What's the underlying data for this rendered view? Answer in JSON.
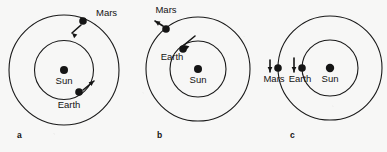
{
  "figure": {
    "type": "orbital-diagram",
    "background_color": "#f7f7f6",
    "line_color": "#1a1a1a",
    "body_color": "#151515"
  },
  "panels": [
    {
      "id": "a",
      "label": "a",
      "label_pos": {
        "x": 17,
        "y": 138
      },
      "sun": {
        "name": "Sun",
        "label": "Sun",
        "cx": 64,
        "cy": 70,
        "r": 4.0,
        "label_x": 64,
        "label_y": 84
      },
      "orbits": [
        {
          "name": "earth-orbit",
          "cx": 64,
          "cy": 70,
          "r": 29.5
        },
        {
          "name": "mars-orbit",
          "cx": 64,
          "cy": 70,
          "r": 55.0
        }
      ],
      "bodies": [
        {
          "name": "Mars",
          "label": "Mars",
          "cx": 83,
          "cy": 21,
          "r": 3.8,
          "label_x": 96,
          "label_y": 16,
          "label_anchor": "start",
          "arrow": {
            "x1": 81,
            "y1": 25,
            "x2": 72,
            "y2": 33,
            "head_angle": 222
          }
        },
        {
          "name": "Earth",
          "label": "Earth",
          "cx": 79,
          "cy": 92,
          "r": 3.8,
          "label_x": 69,
          "label_y": 108,
          "label_anchor": "middle",
          "arrow": {
            "x1": 83,
            "y1": 90,
            "x2": 94,
            "y2": 81,
            "head_angle": 321
          }
        }
      ]
    },
    {
      "id": "b",
      "label": "b",
      "label_pos": {
        "x": 157,
        "y": 138
      },
      "sun": {
        "name": "Sun",
        "label": "Sun",
        "cx": 198,
        "cy": 69,
        "r": 4.0,
        "label_x": 198,
        "label_y": 83
      },
      "orbits": [
        {
          "name": "earth-orbit",
          "cx": 198,
          "cy": 69,
          "r": 28.0
        },
        {
          "name": "mars-orbit",
          "cx": 198,
          "cy": 69,
          "r": 52.0
        }
      ],
      "bodies": [
        {
          "name": "Mars",
          "label": "Mars",
          "cx": 166,
          "cy": 29,
          "r": 3.8,
          "label_x": 166,
          "label_y": 13,
          "label_anchor": "middle",
          "arrow": {
            "x1": 163,
            "y1": 26,
            "x2": 155,
            "y2": 21,
            "head_angle": 212
          }
        },
        {
          "name": "Earth",
          "label": "Earth",
          "cx": 183,
          "cy": 49,
          "r": 3.8,
          "label_x": 172,
          "label_y": 60,
          "label_anchor": "middle",
          "arrow": {
            "x1": 195,
            "y1": 36,
            "x2": 184,
            "y2": 45,
            "head_angle": 219
          }
        }
      ]
    },
    {
      "id": "c",
      "label": "c",
      "label_pos": {
        "x": 290,
        "y": 138
      },
      "sun": {
        "name": "Sun",
        "label": "Sun",
        "cx": 330,
        "cy": 68,
        "r": 4.2,
        "label_x": 330,
        "label_y": 82
      },
      "orbits": [
        {
          "name": "earth-orbit",
          "cx": 330,
          "cy": 68,
          "r": 28.0
        },
        {
          "name": "mars-orbit",
          "cx": 330,
          "cy": 68,
          "r": 52.0
        }
      ],
      "bodies": [
        {
          "name": "Mars",
          "label": "Mars",
          "cx": 278,
          "cy": 68,
          "r": 3.8,
          "label_x": 274,
          "label_y": 82,
          "label_anchor": "middle",
          "arrow": {
            "x1": 270,
            "y1": 60,
            "x2": 270,
            "y2": 72,
            "head_angle": 90
          }
        },
        {
          "name": "Earth",
          "label": "Earth",
          "cx": 302,
          "cy": 68,
          "r": 3.8,
          "label_x": 300,
          "label_y": 82,
          "label_anchor": "middle",
          "arrow": {
            "x1": 294,
            "y1": 58,
            "x2": 294,
            "y2": 72,
            "head_angle": 90
          }
        }
      ]
    }
  ]
}
